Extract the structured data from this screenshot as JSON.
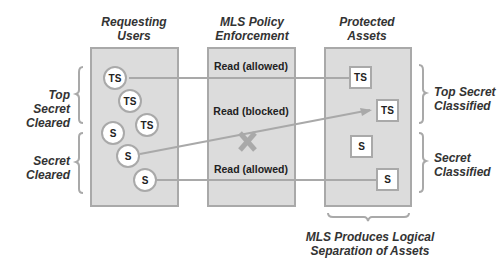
{
  "columns": {
    "users_title_1": "Requesting",
    "users_title_2": "Users",
    "policy_title_1": "MLS Policy",
    "policy_title_2": "Enforcement",
    "assets_title_1": "Protected",
    "assets_title_2": "Assets"
  },
  "left_labels": {
    "top_1": "Top Secret",
    "top_2": "Cleared",
    "bottom_1": "Secret",
    "bottom_2": "Cleared"
  },
  "right_labels": {
    "top_1": "Top Secret",
    "top_2": "Classified",
    "bottom_1": "Secret",
    "bottom_2": "Classified"
  },
  "users": [
    {
      "label": "TS"
    },
    {
      "label": "TS"
    },
    {
      "label": "TS"
    },
    {
      "label": "S"
    },
    {
      "label": "S"
    },
    {
      "label": "S"
    }
  ],
  "rules": [
    {
      "label": "Read (allowed)"
    },
    {
      "label": "Read (blocked)"
    },
    {
      "label": "Read (allowed)"
    }
  ],
  "assets": [
    {
      "label": "TS"
    },
    {
      "label": "TS"
    },
    {
      "label": "S"
    },
    {
      "label": "S"
    }
  ],
  "caption": {
    "line_1": "MLS Produces Logical",
    "line_2": "Separation of Assets"
  },
  "colors": {
    "panel_fill": "#dcdcdc",
    "border": "#a9a9a9",
    "text": "#222222"
  }
}
